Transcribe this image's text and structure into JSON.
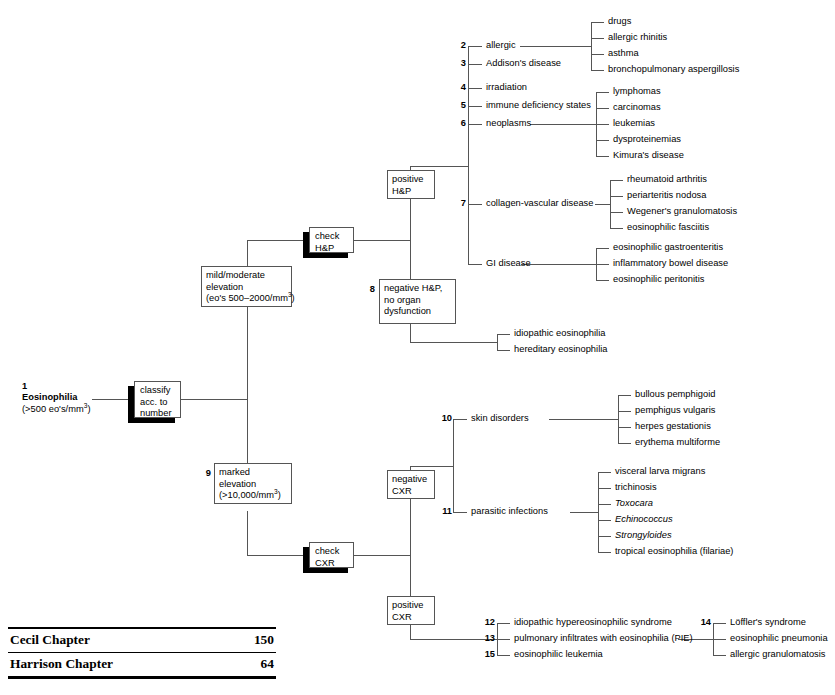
{
  "root": {
    "number": "1",
    "label": "Eosinophilia",
    "detail_prefix": "(>500 eo's/mm",
    "detail_sup": "3",
    "detail_suffix": ")"
  },
  "actions": {
    "classify_line1": "classify",
    "classify_line2": "acc. to",
    "classify_line3": "number",
    "check_hp_line1": "check",
    "check_hp_line2": "H&P",
    "check_cxr_line1": "check",
    "check_cxr_line2": "CXR"
  },
  "branches": {
    "mild_line1": "mild/moderate",
    "mild_line2": "elevation",
    "mild_line3_prefix": "(eo's 500–2000/mm",
    "mild_line3_sup": "3",
    "mild_line3_suffix": ")",
    "marked_number": "9",
    "marked_line1": "marked",
    "marked_line2": "elevation",
    "marked_line3_prefix": "(>10,000/mm",
    "marked_line3_sup": "3",
    "marked_line3_suffix": ")",
    "positive_hp_line1": "positive",
    "positive_hp_line2": "H&P",
    "negative_hp_number": "8",
    "negative_hp_line1": "negative H&P,",
    "negative_hp_line2": "no organ",
    "negative_hp_line3": "dysfunction",
    "negative_cxr_line1": "negative",
    "negative_cxr_line2": "CXR",
    "positive_cxr_line1": "positive",
    "positive_cxr_line2": "CXR"
  },
  "positive_hp_causes": [
    {
      "number": "2",
      "label": "allergic"
    },
    {
      "number": "3",
      "label": "Addison's disease"
    },
    {
      "number": "4",
      "label": "irradiation"
    },
    {
      "number": "5",
      "label": "immune deficiency states"
    },
    {
      "number": "6",
      "label": "neoplasms"
    },
    {
      "number": "7",
      "label": "collagen-vascular disease"
    },
    {
      "number": "",
      "label": "GI disease"
    }
  ],
  "allergic_items": [
    "drugs",
    "allergic rhinitis",
    "asthma",
    "bronchopulmonary aspergillosis"
  ],
  "neoplasm_items": [
    "lymphomas",
    "carcinomas",
    "leukemias",
    "dysproteinemias",
    "Kimura's disease"
  ],
  "collagen_items": [
    "rheumatoid arthritis",
    "periarteritis nodosa",
    "Wegener's granulomatosis",
    "eosinophilic fasciitis"
  ],
  "gi_items": [
    "eosinophilic gastroenteritis",
    "inflammatory bowel disease",
    "eosinophilic peritonitis"
  ],
  "negative_hp_items": [
    "idiopathic eosinophilia",
    "hereditary eosinophilia"
  ],
  "negative_cxr_causes": [
    {
      "number": "10",
      "label": "skin disorders"
    },
    {
      "number": "11",
      "label": "parasitic infections"
    }
  ],
  "skin_items": [
    "bullous pemphigoid",
    "pemphigus vulgaris",
    "herpes gestationis",
    "erythema multiforme"
  ],
  "parasitic_items": [
    {
      "label": "visceral larva migrans",
      "italic": false
    },
    {
      "label": "trichinosis",
      "italic": false
    },
    {
      "label": "Toxocara",
      "italic": true
    },
    {
      "label": "Echinococcus",
      "italic": true
    },
    {
      "label": "Strongyloides",
      "italic": true
    },
    {
      "label": "tropical eosinophilia (filariae)",
      "italic": false
    }
  ],
  "positive_cxr_items": [
    {
      "number": "12",
      "label": "idiopathic hypereosinophilic syndrome"
    },
    {
      "number": "13",
      "label": "pulmonary infiltrates with eosinophilia (PIE)"
    },
    {
      "number": "15",
      "label": "eosinophilic leukemia"
    }
  ],
  "pie_items": [
    {
      "number": "14",
      "label": "Löffler's syndrome"
    },
    {
      "number": "",
      "label": "eosinophilic pneumonia"
    },
    {
      "number": "",
      "label": "allergic granulomatosis"
    }
  ],
  "footer": {
    "rows": [
      {
        "name": "Cecil Chapter",
        "value": "150"
      },
      {
        "name": "Harrison Chapter",
        "value": "64"
      }
    ]
  },
  "colors": {
    "line": "#555555",
    "text": "#000000",
    "shadow": "#000000",
    "background": "#ffffff"
  }
}
